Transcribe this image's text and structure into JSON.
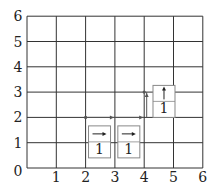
{
  "grid": {
    "xmax": 6,
    "ymax": 6,
    "origin_label": "0",
    "x_ticks": [
      "1",
      "2",
      "3",
      "4",
      "5",
      "6"
    ],
    "y_ticks": [
      "1",
      "2",
      "3",
      "4",
      "5",
      "6"
    ]
  },
  "path": {
    "points": [
      [
        2,
        2
      ],
      [
        3,
        2
      ],
      [
        4,
        2
      ],
      [
        4,
        3
      ]
    ],
    "color": "#555555"
  },
  "cards": [
    {
      "x": 2.1,
      "y": 0.4,
      "arrow": "right",
      "value": "1"
    },
    {
      "x": 3.1,
      "y": 0.4,
      "arrow": "right",
      "value": "1"
    },
    {
      "x": 4.3,
      "y": 2.0,
      "arrow": "up",
      "value": "1"
    }
  ]
}
